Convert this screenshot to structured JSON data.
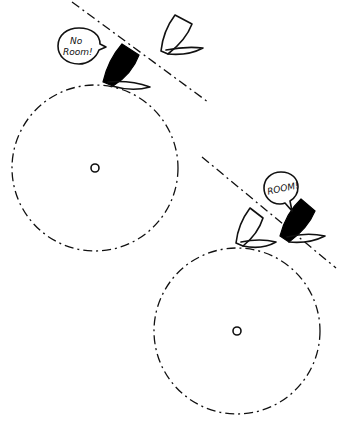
{
  "diagram": {
    "title": "",
    "scenes": [
      {
        "id": "scene-no-room",
        "speech_bubble": {
          "speaker": "black-boat",
          "lines": [
            "No",
            "Room!"
          ]
        },
        "boats": [
          {
            "role": "speaker",
            "hull_color": "#000000"
          },
          {
            "role": "other",
            "hull_color": "#ffffff"
          }
        ],
        "mark": "circle-center"
      },
      {
        "id": "scene-room",
        "speech_bubble": {
          "speaker": "black-boat",
          "lines": [
            "ROOM!"
          ]
        },
        "boats": [
          {
            "role": "speaker",
            "hull_color": "#000000"
          },
          {
            "role": "other",
            "hull_color": "#ffffff"
          }
        ],
        "mark": "circle-center"
      }
    ]
  }
}
